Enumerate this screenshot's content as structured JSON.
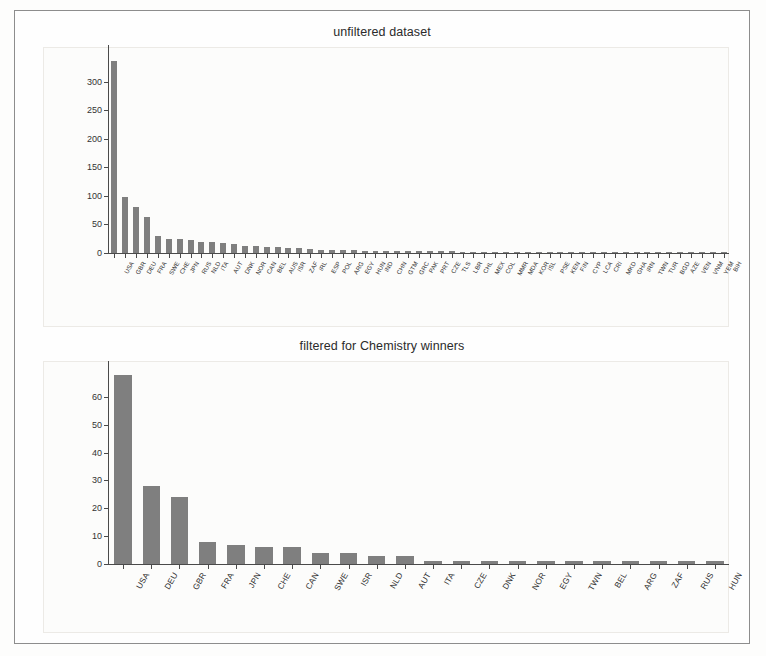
{
  "figure": {
    "background_color": "#fdfdfc",
    "frame_color": "#8d8d8d",
    "bar_color": "#7f7f7f",
    "axis_color": "#4a4a4a"
  },
  "charts": [
    {
      "id": "unfiltered",
      "title": "unfiltered dataset"
    },
    {
      "id": "chemistry",
      "title": "filtered for Chemistry winners"
    }
  ],
  "chart_data": [
    {
      "type": "bar",
      "title": "unfiltered dataset",
      "xlabel": "",
      "ylabel": "",
      "ylim": [
        0,
        350
      ],
      "yticks": [
        0,
        50,
        100,
        150,
        200,
        250,
        300
      ],
      "grid": false,
      "legend": null,
      "categories": [
        "USA",
        "GBR",
        "DEU",
        "FRA",
        "SWE",
        "CHE",
        "JPN",
        "RUS",
        "NLD",
        "ITA",
        "AUT",
        "DNK",
        "NOR",
        "CAN",
        "BEL",
        "AUS",
        "ISR",
        "ZAF",
        "IRL",
        "ESP",
        "POL",
        "ARG",
        "EGY",
        "HUN",
        "IND",
        "CHN",
        "GTM",
        "GRC",
        "PAK",
        "PRT",
        "CZE",
        "TLS",
        "LBR",
        "CHL",
        "MEX",
        "COL",
        "MMR",
        "MDA",
        "KOR",
        "ISL",
        "PSE",
        "KEN",
        "FIN",
        "CYP",
        "LCA",
        "CRI",
        "MKD",
        "GHA",
        "IRN",
        "TWN",
        "TUR",
        "BGD",
        "AZE",
        "VEN",
        "VNM",
        "YEM",
        "BIH"
      ],
      "values": [
        336,
        98,
        80,
        63,
        30,
        25,
        24,
        22,
        20,
        19,
        18,
        15,
        13,
        12,
        11,
        10,
        9,
        8,
        7,
        6,
        6,
        5,
        5,
        4,
        4,
        4,
        4,
        3,
        3,
        3,
        3,
        3,
        2,
        2,
        2,
        2,
        2,
        2,
        2,
        2,
        2,
        2,
        2,
        1,
        1,
        1,
        1,
        1,
        1,
        1,
        1,
        1,
        1,
        1,
        1,
        1,
        1
      ]
    },
    {
      "type": "bar",
      "title": "filtered for Chemistry winners",
      "xlabel": "",
      "ylabel": "",
      "ylim": [
        0,
        70
      ],
      "yticks": [
        0,
        10,
        20,
        30,
        40,
        50,
        60
      ],
      "grid": false,
      "legend": null,
      "categories": [
        "USA",
        "DEU",
        "GBR",
        "FRA",
        "JPN",
        "CHE",
        "CAN",
        "SWE",
        "ISR",
        "NLD",
        "AUT",
        "ITA",
        "CZE",
        "DNK",
        "NOR",
        "EGY",
        "TWN",
        "BEL",
        "ARG",
        "ZAF",
        "RUS",
        "HUN"
      ],
      "values": [
        68,
        28,
        24,
        8,
        7,
        6,
        6,
        4,
        4,
        3,
        3,
        1,
        1,
        1,
        1,
        1,
        1,
        1,
        1,
        1,
        1,
        1
      ]
    }
  ]
}
